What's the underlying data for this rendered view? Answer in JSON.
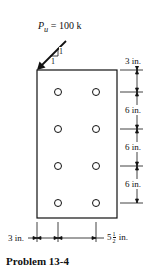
{
  "figure": {
    "title": "Problem 13-4",
    "load": {
      "symbol": "P",
      "subscript": "u",
      "value_text": "= 100 k",
      "slope_rise": "1",
      "slope_run": "1"
    },
    "plate": {
      "hole_columns": 2,
      "hole_rows": 4
    },
    "vertical_dimensions": [
      "3 in.",
      "6 in.",
      "6 in.",
      "6 in."
    ],
    "horizontal_dimensions": {
      "edge": "3 in.",
      "gage_whole": "5",
      "gage_num": "1",
      "gage_den": "2",
      "gage_unit": "in."
    }
  }
}
